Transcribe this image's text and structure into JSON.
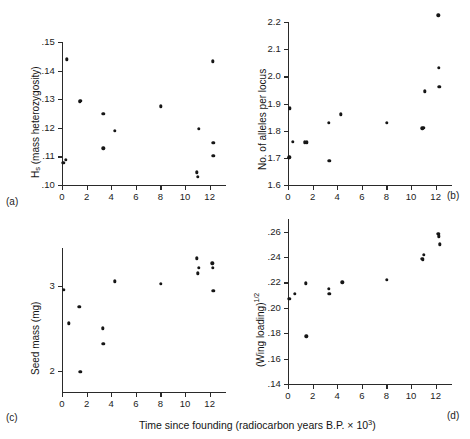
{
  "figure": {
    "xlabel_main": "Time since founding (radiocarbon years B.P. ",
    "xlabel_times": "× 10",
    "xlabel_exp": "3",
    "xlabel_close": ")",
    "panel_tags": {
      "a": "(a)",
      "b": "(b)",
      "c": "(c)",
      "d": "(d)"
    }
  },
  "chart_data": [
    {
      "type": "scatter",
      "panel": "(a)",
      "title": "",
      "xlabel": "Time since founding (radiocarbon years B.P. × 10³)",
      "ylabel": "Hₛ (mass heterozygosity)",
      "ylabel_base": "H",
      "ylabel_sub": "s",
      "ylabel_rest": " (mass heterozygosity)",
      "xlim": [
        0,
        13
      ],
      "ylim": [
        0.1,
        0.15
      ],
      "xticks": [
        0,
        2,
        4,
        6,
        8,
        10,
        12
      ],
      "xticklabels": [
        "0",
        "2",
        "4",
        "6",
        "8",
        "10",
        "12"
      ],
      "yticks": [
        0.1,
        0.11,
        0.12,
        0.13,
        0.14,
        0.15
      ],
      "yticklabels": [
        ".10",
        ".11",
        ".12",
        ".13",
        ".14",
        ".15"
      ],
      "grid": false,
      "legend": "none",
      "points": [
        {
          "x": 0.1,
          "y": 0.1078
        },
        {
          "x": 0.3,
          "y": 0.1088
        },
        {
          "x": 0.4,
          "y": 0.144
        },
        {
          "x": 1.45,
          "y": 0.129
        },
        {
          "x": 1.5,
          "y": 0.1295
        },
        {
          "x": 3.35,
          "y": 0.1248
        },
        {
          "x": 3.35,
          "y": 0.1128
        },
        {
          "x": 4.3,
          "y": 0.119
        },
        {
          "x": 8.05,
          "y": 0.1275
        },
        {
          "x": 10.95,
          "y": 0.1045
        },
        {
          "x": 11.05,
          "y": 0.1028
        },
        {
          "x": 11.1,
          "y": 0.1197
        },
        {
          "x": 12.25,
          "y": 0.1432
        },
        {
          "x": 12.3,
          "y": 0.1148
        },
        {
          "x": 12.3,
          "y": 0.1103
        }
      ]
    },
    {
      "type": "scatter",
      "panel": "(b)",
      "title": "",
      "xlabel": "Time since founding (radiocarbon years B.P. × 10³)",
      "ylabel": "No. of alleles per locus",
      "xlim": [
        0,
        13
      ],
      "ylim": [
        1.6,
        2.2
      ],
      "xticks": [
        0,
        2,
        4,
        6,
        8,
        10,
        12
      ],
      "xticklabels": [
        "0",
        "2",
        "4",
        "6",
        "8",
        "10",
        "12"
      ],
      "yticks": [
        1.6,
        1.7,
        1.8,
        1.9,
        2.0,
        2.1,
        2.2
      ],
      "yticklabels": [
        "1.6",
        "1.7",
        "1.8",
        "1.9",
        "2.0",
        "2.1",
        "2.2"
      ],
      "grid": false,
      "legend": "none",
      "points": [
        {
          "x": 0.05,
          "y": 1.7
        },
        {
          "x": 0.1,
          "y": 1.702
        },
        {
          "x": 0.15,
          "y": 1.882
        },
        {
          "x": 0.4,
          "y": 1.76
        },
        {
          "x": 1.35,
          "y": 1.757
        },
        {
          "x": 1.55,
          "y": 1.757
        },
        {
          "x": 3.3,
          "y": 1.83
        },
        {
          "x": 3.35,
          "y": 1.688
        },
        {
          "x": 4.3,
          "y": 1.86
        },
        {
          "x": 8.05,
          "y": 1.83
        },
        {
          "x": 10.9,
          "y": 1.808
        },
        {
          "x": 11.05,
          "y": 1.81
        },
        {
          "x": 11.1,
          "y": 1.945
        },
        {
          "x": 12.2,
          "y": 2.225
        },
        {
          "x": 12.25,
          "y": 2.032
        },
        {
          "x": 12.3,
          "y": 1.962
        }
      ]
    },
    {
      "type": "scatter",
      "panel": "(c)",
      "title": "",
      "xlabel": "Time since founding (radiocarbon years B.P. × 10³)",
      "ylabel": "Seed mass (mg)",
      "xlim": [
        0,
        13
      ],
      "ylim": [
        1.75,
        3.45
      ],
      "xticks": [
        0,
        2,
        4,
        6,
        8,
        10,
        12
      ],
      "xticklabels": [
        "0",
        "2",
        "4",
        "6",
        "8",
        "10",
        "12"
      ],
      "yticks": [
        2,
        3
      ],
      "yticklabels": [
        "2",
        "3"
      ],
      "grid": false,
      "legend": "none",
      "points": [
        {
          "x": 0.15,
          "y": 2.955
        },
        {
          "x": 0.55,
          "y": 2.56
        },
        {
          "x": 1.4,
          "y": 2.755
        },
        {
          "x": 1.5,
          "y": 1.99
        },
        {
          "x": 3.3,
          "y": 2.5
        },
        {
          "x": 3.35,
          "y": 2.32
        },
        {
          "x": 4.3,
          "y": 3.055
        },
        {
          "x": 8.05,
          "y": 3.03
        },
        {
          "x": 10.95,
          "y": 3.33
        },
        {
          "x": 11.05,
          "y": 3.15
        },
        {
          "x": 11.1,
          "y": 3.215
        },
        {
          "x": 12.2,
          "y": 3.27
        },
        {
          "x": 12.25,
          "y": 3.215
        },
        {
          "x": 12.3,
          "y": 2.945
        }
      ]
    },
    {
      "type": "scatter",
      "panel": "(d)",
      "title": "",
      "xlabel": "Time since founding (radiocarbon years B.P. × 10³)",
      "ylabel": "(Wing loading)¹ᐟ²",
      "ylabel_base": "(Wing loading)",
      "ylabel_sup": "1/2",
      "xlim": [
        0,
        13
      ],
      "ylim": [
        0.14,
        0.27
      ],
      "xticks": [
        0,
        2,
        4,
        6,
        8,
        10,
        12
      ],
      "xticklabels": [
        "0",
        "2",
        "4",
        "6",
        "8",
        "10",
        "12"
      ],
      "yticks": [
        0.14,
        0.16,
        0.18,
        0.2,
        0.22,
        0.24,
        0.26
      ],
      "yticklabels": [
        ".14",
        ".16",
        ".18",
        ".20",
        ".22",
        ".24",
        ".26"
      ],
      "grid": false,
      "legend": "none",
      "points": [
        {
          "x": 0.1,
          "y": 0.207
        },
        {
          "x": 0.55,
          "y": 0.211
        },
        {
          "x": 1.45,
          "y": 0.2193
        },
        {
          "x": 1.5,
          "y": 0.1775
        },
        {
          "x": 3.3,
          "y": 0.215
        },
        {
          "x": 3.35,
          "y": 0.211
        },
        {
          "x": 4.4,
          "y": 0.22
        },
        {
          "x": 8.05,
          "y": 0.222
        },
        {
          "x": 10.9,
          "y": 0.2385
        },
        {
          "x": 10.95,
          "y": 0.238
        },
        {
          "x": 11.05,
          "y": 0.242
        },
        {
          "x": 12.2,
          "y": 0.2585
        },
        {
          "x": 12.25,
          "y": 0.2565
        },
        {
          "x": 12.35,
          "y": 0.25
        }
      ]
    }
  ]
}
